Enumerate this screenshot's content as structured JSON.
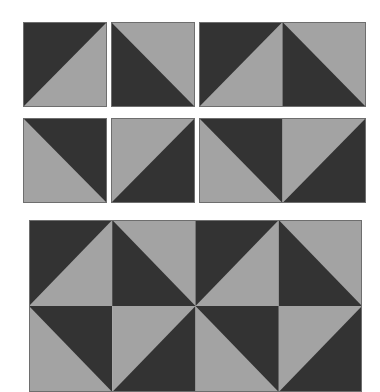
{
  "colors": {
    "dark": "#333333",
    "light": "#a3a3a3",
    "border": "#6e6e6e",
    "background": "#ffffff"
  },
  "blocks": [
    {
      "id": "hst-a",
      "x": 23,
      "y": 22,
      "w": 84,
      "h": 85,
      "cells": [
        [
          "dark-tl"
        ]
      ]
    },
    {
      "id": "hst-b",
      "x": 111,
      "y": 22,
      "w": 84,
      "h": 85,
      "cells": [
        [
          "dark-bl"
        ]
      ]
    },
    {
      "id": "pair-top",
      "x": 199,
      "y": 22,
      "w": 167,
      "h": 85,
      "cells": [
        [
          "dark-tl",
          "dark-bl"
        ]
      ]
    },
    {
      "id": "hst-c",
      "x": 23,
      "y": 118,
      "w": 84,
      "h": 85,
      "cells": [
        [
          "dark-tr"
        ]
      ]
    },
    {
      "id": "hst-d",
      "x": 111,
      "y": 118,
      "w": 84,
      "h": 85,
      "cells": [
        [
          "dark-br"
        ]
      ]
    },
    {
      "id": "pair-bottom",
      "x": 199,
      "y": 118,
      "w": 167,
      "h": 85,
      "cells": [
        [
          "dark-tr",
          "dark-br"
        ]
      ]
    },
    {
      "id": "grid-4x2",
      "x": 29,
      "y": 220,
      "w": 333,
      "h": 172,
      "cells": [
        [
          "dark-tl",
          "dark-bl",
          "dark-tl",
          "dark-bl"
        ],
        [
          "dark-tr",
          "dark-br",
          "dark-tr",
          "dark-br"
        ]
      ]
    }
  ]
}
